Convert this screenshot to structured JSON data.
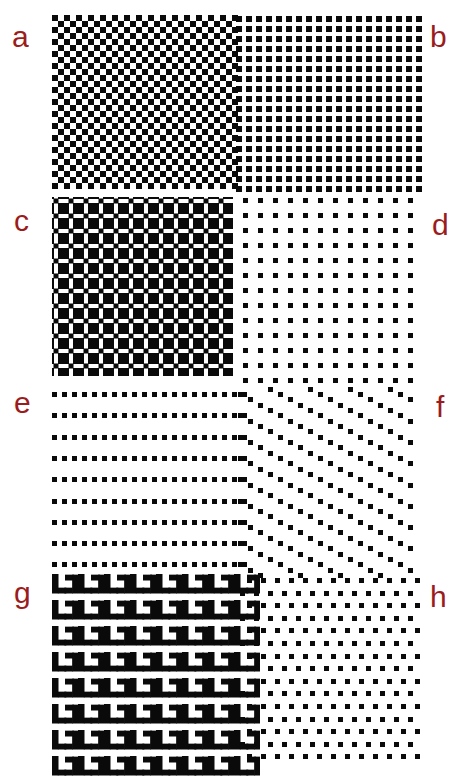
{
  "figure": {
    "background": "#ffffff",
    "ink": "#0a0a0a",
    "label_color": "#9b1c1c",
    "panels": [
      {
        "id": "a",
        "label": "a",
        "pattern": "checkerboard",
        "description": "Fine checkerboard of black and white squares"
      },
      {
        "id": "b",
        "label": "b",
        "pattern": "square-dot-grid",
        "description": "Dense square lattice of small black squares"
      },
      {
        "id": "c",
        "label": "c",
        "pattern": "blocks-with-intersection-dots",
        "description": "Large black blocks separated by white lines with small squares at intersections"
      },
      {
        "id": "d",
        "label": "d",
        "pattern": "sparse-dot-grid",
        "description": "Sparse square lattice of small black squares"
      },
      {
        "id": "e",
        "label": "e",
        "pattern": "horizontal-dot-rows",
        "description": "Rows of closely spaced squares with wide row spacing"
      },
      {
        "id": "f",
        "label": "f",
        "pattern": "oblique-dot-rows",
        "description": "Rows of squares tilted downward in a sheared lattice"
      },
      {
        "id": "g",
        "label": "g",
        "pattern": "l-shape-tiling",
        "description": "Tiling of L and mirrored-J shapes"
      },
      {
        "id": "h",
        "label": "h",
        "pattern": "staggered-dot-lattice",
        "description": "Hexagonal-like staggered lattice of squares"
      }
    ]
  }
}
